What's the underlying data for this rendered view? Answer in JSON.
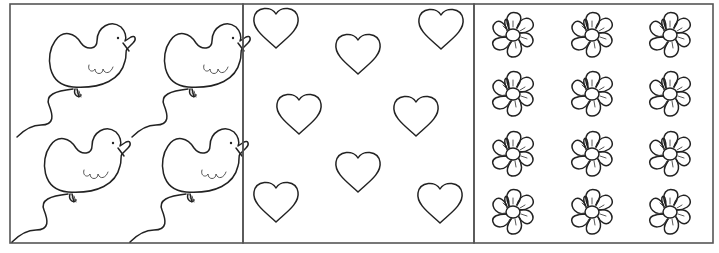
{
  "worksheet": {
    "panels": [
      {
        "id": "ducks",
        "shape": "duck-balloon-icon",
        "count": 4,
        "positions": [
          [
            85,
            35
          ],
          [
            200,
            35
          ],
          [
            80,
            140
          ],
          [
            198,
            140
          ]
        ]
      },
      {
        "id": "hearts",
        "shape": "heart-icon",
        "count": 8,
        "positions": [
          [
            276,
            37
          ],
          [
            358,
            62
          ],
          [
            441,
            37
          ],
          [
            299,
            120
          ],
          [
            416,
            122
          ],
          [
            358,
            179
          ],
          [
            276,
            208
          ],
          [
            440,
            208
          ]
        ]
      },
      {
        "id": "flowers",
        "shape": "flower-icon",
        "count": 12,
        "columns": [
          513,
          592,
          670
        ],
        "rows": [
          35,
          93,
          153,
          211
        ]
      }
    ],
    "colors": {
      "ink": "#222222",
      "border": "#555555",
      "background": "#ffffff"
    }
  }
}
